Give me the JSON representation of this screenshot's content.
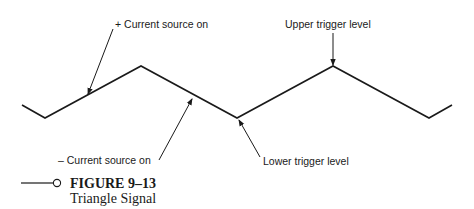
{
  "figure": {
    "number_label": "FIGURE 9–13",
    "title": "Triangle Signal"
  },
  "annotations": {
    "plus_current": "+ Current source on",
    "minus_current": "– Current source on",
    "upper_trigger": "Upper trigger level",
    "lower_trigger": "Lower trigger level"
  },
  "waveform": {
    "type": "triangle",
    "color": "#1a1a1a",
    "points": [
      [
        22,
        105
      ],
      [
        45,
        118
      ],
      [
        141,
        66
      ],
      [
        237,
        118
      ],
      [
        333,
        66
      ],
      [
        429,
        118
      ],
      [
        452,
        105
      ]
    ]
  }
}
